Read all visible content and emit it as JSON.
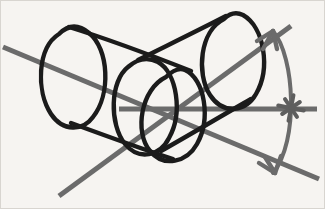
{
  "figure": {
    "canvas": {
      "width": 325,
      "height": 209,
      "background_color": "#f6f4f1",
      "border_color": "#d8d5d0"
    },
    "palette": {
      "ink_black": "#1b1b1b",
      "axis_gray": "#6b6b6b",
      "arc_gray": "#6b6b6b",
      "marker_gray": "#5e5e5e",
      "background": "#f6f4f1"
    },
    "stroke_widths": {
      "cylinder": 4.4,
      "axis": 5.0,
      "arc": 4.0,
      "arrow": 4.4,
      "star": 4.0
    }
  },
  "shapes": {
    "left_cylinder": {
      "name": "left-cylinder",
      "color": "#1b1b1b",
      "far_ellipse_path": "M 58 33 C 36 47 35 90 50 113 C 62 131 82 130 92 116 C 110 93 108 48 88 32 C 76 22 66 25 58 33 Z",
      "near_ellipse_path": "M 165 76 C 140 88 133 131 149 150 C 163 167 186 161 196 143 C 210 118 204 78 184 69 C 177 66 171 70 165 76 Z",
      "top_silhouette_path": "M 68 26 C 110 39 152 55 190 70",
      "bottom_silhouette_path": "M 70 122 C 108 136 144 149 172 158"
    },
    "right_cylinder": {
      "name": "right-cylinder",
      "color": "#1b1b1b",
      "far_ellipse_path": "M 223 18 C 199 30 195 72 209 94 C 222 114 245 111 255 93 C 270 67 263 26 242 14 C 234 10 228 13 223 18 Z",
      "near_ellipse_path": "M 127 66 C 109 80 108 123 124 143 C 138 160 159 155 168 137 C 182 112 176 72 157 61 C 147 56 136 58 127 66 Z",
      "top_silhouette_path": "M 137 59 C 165 45 196 30 225 15",
      "bottom_silhouette_path": "M 160 150 C 190 133 222 114 250 98"
    },
    "axis_lines": [
      {
        "name": "axis-line-upper-left",
        "color": "#6b6b6b",
        "x1": 2,
        "y1": 46,
        "x2": 318,
        "y2": 178,
        "note": "long diagonal running from upper-left down to lower-right, passing beneath the bottom arrow"
      },
      {
        "name": "axis-line-lower-left",
        "color": "#6b6b6b",
        "x1": 58,
        "y1": 195,
        "x2": 290,
        "y2": 25,
        "note": "diagonal running from lower-left up to the upper-right arrowhead on the arc"
      },
      {
        "name": "axis-line-horizontal",
        "color": "#6b6b6b",
        "x1": 118,
        "y1": 108,
        "x2": 316,
        "y2": 108,
        "note": "horizontal reference line ending at the star marker"
      }
    ],
    "angle_arc": {
      "name": "angle-arc",
      "color": "#6b6b6b",
      "path": "M 272 30 C 294 56 298 140 272 172",
      "arrow_top": {
        "name": "arrow-head-top",
        "tip_x": 272,
        "tip_y": 30,
        "barb_a": "M 272 30 L 256 40",
        "barb_b": "M 272 30 L 262 48",
        "barb_c": "M 272 30 L 276 48"
      },
      "arrow_bottom": {
        "name": "arrow-head-bottom",
        "tip_x": 274,
        "tip_y": 172,
        "barb_a": "M 274 172 L 258 162",
        "barb_b": "M 274 172 L 264 156",
        "barb_c": "M 274 172 L 280 155"
      }
    },
    "star_marker": {
      "name": "star-burst-marker",
      "color": "#5e5e5e",
      "center_x": 290,
      "center_y": 107,
      "radius": 13,
      "ray_count": 8
    }
  }
}
